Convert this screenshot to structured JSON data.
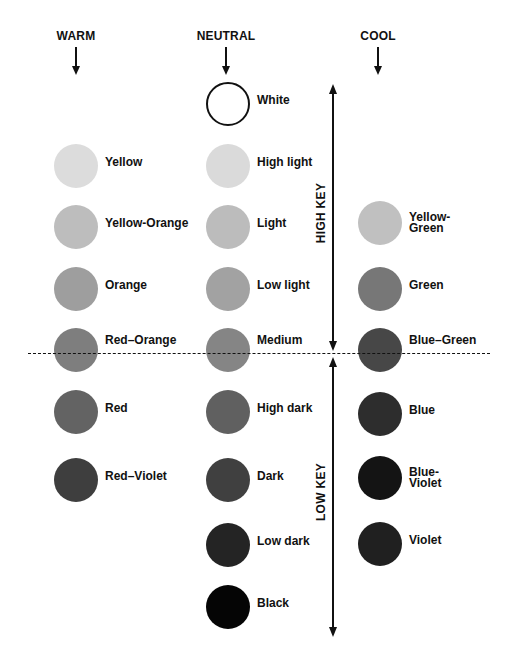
{
  "headings": {
    "warm": "WARM",
    "neutral": "NEUTRAL",
    "cool": "COOL"
  },
  "key_labels": {
    "high": "HIGH KEY",
    "low": "LOW KEY"
  },
  "columns": {
    "warm": {
      "x": 76,
      "items": [
        {
          "label": "Yellow",
          "y": 166,
          "color": "#dcdcdc"
        },
        {
          "label": "Yellow-Orange",
          "y": 227,
          "color": "#bdbdbd"
        },
        {
          "label": "Orange",
          "y": 289,
          "color": "#9e9e9e"
        },
        {
          "label": "Red–Orange",
          "y": 350,
          "color": "#7e7e7e"
        },
        {
          "label": "Red",
          "y": 412,
          "color": "#636363"
        },
        {
          "label": "Red–Violet",
          "y": 480,
          "color": "#3e3e3e"
        }
      ]
    },
    "neutral": {
      "x": 228,
      "items": [
        {
          "label": "White",
          "y": 104,
          "color": "#ffffff",
          "outlined": true
        },
        {
          "label": "High light",
          "y": 166,
          "color": "#dadada"
        },
        {
          "label": "Light",
          "y": 227,
          "color": "#bcbcbc"
        },
        {
          "label": "Low light",
          "y": 289,
          "color": "#a2a2a2"
        },
        {
          "label": "Medium",
          "y": 350,
          "color": "#858585"
        },
        {
          "label": "High dark",
          "y": 412,
          "color": "#606060"
        },
        {
          "label": "Dark",
          "y": 480,
          "color": "#404040"
        },
        {
          "label": "Low dark",
          "y": 545,
          "color": "#242424"
        },
        {
          "label": "Black",
          "y": 607,
          "color": "#050505"
        }
      ]
    },
    "cool": {
      "x": 380,
      "items": [
        {
          "label": "Yellow-\nGreen",
          "y": 223,
          "color": "#c0c0c0"
        },
        {
          "label": "Green",
          "y": 289,
          "color": "#777777"
        },
        {
          "label": "Blue–Green",
          "y": 350,
          "color": "#474747"
        },
        {
          "label": "Blue",
          "y": 414,
          "color": "#2d2d2d"
        },
        {
          "label": "Blue-\nViolet",
          "y": 478,
          "color": "#141414"
        },
        {
          "label": "Violet",
          "y": 544,
          "color": "#202020"
        }
      ]
    }
  }
}
